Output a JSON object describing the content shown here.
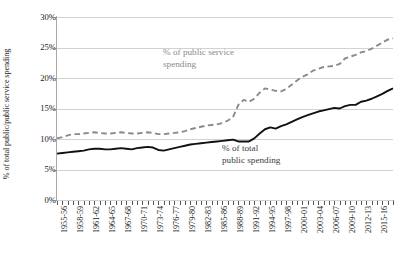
{
  "chart_data": {
    "type": "line",
    "title": "",
    "xlabel": "",
    "ylabel": "% of total public/public service spending",
    "ylim": [
      0,
      30
    ],
    "ytick_labels": [
      "0%",
      "5%",
      "10%",
      "15%",
      "20%",
      "25%",
      "30%"
    ],
    "ytick_values": [
      0,
      5,
      10,
      15,
      20,
      25,
      30
    ],
    "grid": true,
    "legend_position": "inline-annotation",
    "x": [
      "1955-56",
      "1956-57",
      "1957-58",
      "1958-59",
      "1959-60",
      "1960-61",
      "1961-62",
      "1962-63",
      "1963-64",
      "1964-65",
      "1965-66",
      "1966-67",
      "1967-68",
      "1968-69",
      "1969-70",
      "1970-71",
      "1971-72",
      "1972-73",
      "1973-74",
      "1974-75",
      "1975-76",
      "1976-77",
      "1977-78",
      "1978-79",
      "1979-80",
      "1980-81",
      "1981-82",
      "1982-83",
      "1983-84",
      "1984-85",
      "1985-86",
      "1986-87",
      "1987-88",
      "1988-89",
      "1989-90",
      "1990-91",
      "1991-92",
      "1992-93",
      "1993-94",
      "1994-95",
      "1995-96",
      "1996-97",
      "1997-98",
      "1998-99",
      "1999-00",
      "2000-01",
      "2001-02",
      "2002-03",
      "2003-04",
      "2004-05",
      "2005-06",
      "2006-07",
      "2007-08",
      "2008-09",
      "2009-10",
      "2010-11",
      "2011-12",
      "2012-13",
      "2013-14",
      "2014-15",
      "2015-16",
      "2016-17",
      "2017-18",
      "2018-19"
    ],
    "xtick_labels": [
      "1955-56",
      "1958-59",
      "1961-62",
      "1964-65",
      "1967-68",
      "1970-71",
      "1973-74",
      "1976-77",
      "1979-80",
      "1982-83",
      "1985-86",
      "1988-89",
      "1991-92",
      "1994-95",
      "1997-98",
      "2000-01",
      "2003-04",
      "2006-07",
      "2009-10",
      "2012-13",
      "2015-16",
      "2018-19"
    ],
    "series": [
      {
        "name": "% of public service spending",
        "style": "dashed",
        "color": "#8a8a8a",
        "annotation": "% of public service\nspending",
        "values": [
          10.1,
          10.3,
          10.6,
          10.8,
          10.8,
          10.9,
          11.0,
          11.1,
          11.0,
          10.9,
          10.9,
          11.0,
          11.1,
          11.0,
          10.9,
          10.9,
          11.0,
          11.1,
          11.0,
          10.8,
          10.8,
          10.9,
          11.0,
          11.1,
          11.3,
          11.6,
          11.8,
          12.0,
          12.2,
          12.3,
          12.4,
          12.6,
          13.0,
          13.6,
          15.6,
          16.4,
          16.1,
          16.6,
          17.6,
          18.3,
          18.1,
          17.9,
          17.8,
          18.2,
          18.9,
          19.6,
          20.2,
          20.6,
          21.2,
          21.5,
          21.8,
          21.9,
          22.0,
          22.3,
          23.2,
          23.5,
          23.8,
          24.2,
          24.4,
          24.8,
          25.3,
          25.8,
          26.3,
          26.5
        ]
      },
      {
        "name": "% of total public spending",
        "style": "solid",
        "color": "#111111",
        "annotation": "% of total\npublic spending",
        "values": [
          7.6,
          7.7,
          7.8,
          7.9,
          8.0,
          8.1,
          8.3,
          8.4,
          8.4,
          8.3,
          8.3,
          8.4,
          8.5,
          8.4,
          8.3,
          8.5,
          8.6,
          8.7,
          8.6,
          8.2,
          8.1,
          8.3,
          8.5,
          8.7,
          8.9,
          9.1,
          9.2,
          9.3,
          9.4,
          9.5,
          9.6,
          9.7,
          9.8,
          9.9,
          9.6,
          9.6,
          9.6,
          10.1,
          10.9,
          11.6,
          11.9,
          11.7,
          12.1,
          12.4,
          12.8,
          13.2,
          13.6,
          13.9,
          14.2,
          14.5,
          14.7,
          14.9,
          15.1,
          15.0,
          15.4,
          15.6,
          15.6,
          16.1,
          16.3,
          16.6,
          17.0,
          17.4,
          17.9,
          18.3
        ]
      }
    ]
  },
  "annotations": {
    "public_service": "% of public service\nspending",
    "total_public": "% of total\npublic spending"
  },
  "colors": {
    "dashed_series": "#8a8a8a",
    "solid_series": "#111111",
    "gridline": "#d2d2d2",
    "axis": "#8e8e8e",
    "text": "#1a1a1a"
  }
}
